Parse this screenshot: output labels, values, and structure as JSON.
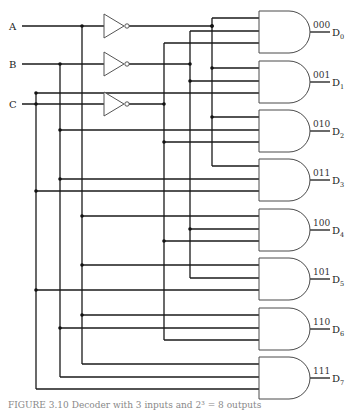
{
  "diagram": {
    "inputs": [
      {
        "label": "A",
        "y": 26,
        "x_vert": 82,
        "inv_y": 26,
        "not_x_vert": 212
      },
      {
        "label": "B",
        "y": 64,
        "x_vert": 60,
        "inv_y": 64,
        "not_x_vert": 190
      },
      {
        "label": "C",
        "y": 104,
        "x_vert": 36,
        "inv_y": 104,
        "not_x_vert": 164
      }
    ],
    "outputs": [
      {
        "code": "000",
        "label": "D",
        "sub": "0",
        "gate_top": 11
      },
      {
        "code": "001",
        "label": "D",
        "sub": "1",
        "gate_top": 61
      },
      {
        "code": "010",
        "label": "D",
        "sub": "2",
        "gate_top": 110
      },
      {
        "code": "011",
        "label": "D",
        "sub": "3",
        "gate_top": 159
      },
      {
        "code": "100",
        "label": "D",
        "sub": "4",
        "gate_top": 209
      },
      {
        "code": "101",
        "label": "D",
        "sub": "5",
        "gate_top": 258
      },
      {
        "code": "110",
        "label": "D",
        "sub": "6",
        "gate_top": 308
      },
      {
        "code": "111",
        "label": "D",
        "sub": "7",
        "gate_top": 357
      }
    ]
  },
  "caption": "FIGURE 3.10  Decoder with 3 inputs and 2³ = 8 outputs"
}
